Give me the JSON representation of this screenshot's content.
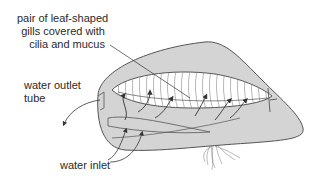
{
  "figure": {
    "colors": {
      "outline": "#555555",
      "shell_fill": "#d4d4d4",
      "gill_fill": "#ffffff",
      "gill_stripes": "#777777",
      "arrow": "#333333",
      "text": "#2a2a2a"
    }
  },
  "labels": {
    "gills": {
      "line1": "pair of leaf-shaped",
      "line2": "gills covered with",
      "line3": "cilia and mucus"
    },
    "outlet": {
      "line1": "water outlet",
      "line2": "tube"
    },
    "inlet": {
      "line1": "water inlet"
    }
  }
}
